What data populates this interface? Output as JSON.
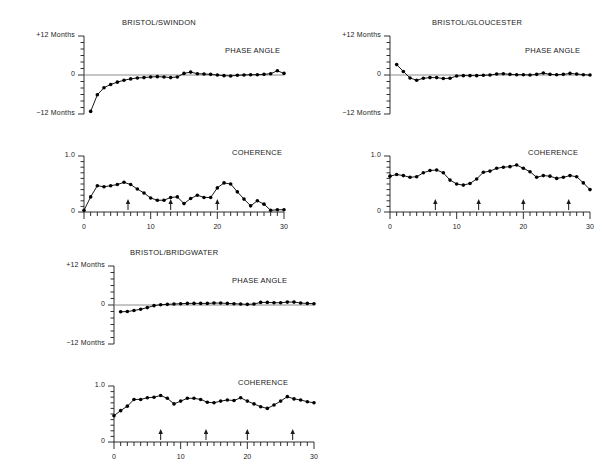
{
  "figure": {
    "panels": [
      {
        "id": "bristol-swindon",
        "title": "BRISTOL/SWINDON",
        "phase_label": "PHASE ANGLE",
        "coherence_label": "COHERENCE",
        "y_top_label": "+12 Months",
        "y_zero_label": "0",
        "y_bottom_label": "−12 Months",
        "coh_top_label": "1.0",
        "coh_zero_label": "0",
        "x_ticks": [
          "0",
          "10",
          "20",
          "30"
        ]
      },
      {
        "id": "bristol-gloucester",
        "title": "BRISTOL/GLOUCESTER",
        "phase_label": "PHASE ANGLE",
        "coherence_label": "COHERENCE",
        "y_top_label": "+12 Months",
        "y_zero_label": "0",
        "y_bottom_label": "−12 Months",
        "coh_top_label": "1.0",
        "coh_zero_label": "0",
        "x_ticks": [
          "0",
          "10",
          "20",
          "30"
        ]
      },
      {
        "id": "bristol-bridgwater",
        "title": "BRISTOL/BRIDGWATER",
        "phase_label": "PHASE ANGLE",
        "coherence_label": "COHERENCE",
        "y_top_label": "+12 Months",
        "y_zero_label": "0",
        "y_bottom_label": "−12 Months",
        "coh_top_label": "1.0",
        "coh_zero_label": "0",
        "x_ticks": [
          "0",
          "10",
          "20",
          "30"
        ]
      }
    ]
  },
  "chart_data": [
    {
      "type": "line",
      "id": "swindon-phase",
      "title": "BRISTOL/SWINDON",
      "annotation": "PHASE ANGLE",
      "xlabel": "",
      "ylabel": "Months",
      "xlim": [
        0,
        30
      ],
      "ylim": [
        -12,
        12
      ],
      "yticks": [
        -12,
        0,
        12
      ],
      "ytick_labels": [
        "−12 Months",
        "0",
        "+12 Months"
      ],
      "xticks": [
        0,
        10,
        20,
        30
      ],
      "grid": false,
      "zero_line": true,
      "x": [
        1,
        2,
        3,
        4,
        5,
        6,
        7,
        8,
        9,
        10,
        11,
        12,
        13,
        14,
        15,
        16,
        17,
        18,
        19,
        20,
        21,
        22,
        23,
        24,
        25,
        26,
        27,
        28,
        29,
        30
      ],
      "values": [
        -11.2,
        -6.1,
        -3.9,
        -2.9,
        -2.2,
        -1.6,
        -1.2,
        -0.9,
        -0.8,
        -0.6,
        -0.5,
        -0.6,
        -0.8,
        -0.6,
        0.5,
        0.9,
        0.4,
        0.3,
        0.2,
        0.0,
        -0.2,
        -0.3,
        -0.1,
        0.0,
        0.1,
        0.1,
        0.2,
        0.4,
        1.3,
        0.5
      ]
    },
    {
      "type": "line",
      "id": "swindon-coherence",
      "title": "",
      "annotation": "COHERENCE",
      "xlabel": "",
      "ylabel": "Coherence",
      "xlim": [
        0,
        30
      ],
      "ylim": [
        0,
        1.0
      ],
      "yticks": [
        0,
        1.0
      ],
      "ytick_labels": [
        "0",
        "1.0"
      ],
      "xticks": [
        0,
        10,
        20,
        30
      ],
      "grid": false,
      "arrows": [
        6.6,
        13.0,
        20.0
      ],
      "x": [
        0,
        1,
        2,
        3,
        4,
        5,
        6,
        7,
        8,
        9,
        10,
        11,
        12,
        13,
        14,
        15,
        16,
        17,
        18,
        19,
        20,
        21,
        22,
        23,
        24,
        25,
        26,
        27,
        28,
        29,
        30
      ],
      "values": [
        0.03,
        0.27,
        0.47,
        0.45,
        0.47,
        0.49,
        0.53,
        0.49,
        0.41,
        0.34,
        0.25,
        0.21,
        0.21,
        0.26,
        0.27,
        0.15,
        0.24,
        0.3,
        0.26,
        0.26,
        0.43,
        0.52,
        0.5,
        0.36,
        0.23,
        0.11,
        0.2,
        0.14,
        0.03,
        0.04,
        0.04
      ]
    },
    {
      "type": "line",
      "id": "gloucester-phase",
      "title": "BRISTOL/GLOUCESTER",
      "annotation": "PHASE ANGLE",
      "xlabel": "",
      "ylabel": "Months",
      "xlim": [
        0,
        30
      ],
      "ylim": [
        -12,
        12
      ],
      "yticks": [
        -12,
        0,
        12
      ],
      "ytick_labels": [
        "−12 Months",
        "0",
        "+12 Months"
      ],
      "xticks": [
        0,
        10,
        20,
        30
      ],
      "grid": false,
      "zero_line": true,
      "x": [
        1,
        2,
        3,
        4,
        5,
        6,
        7,
        8,
        9,
        10,
        11,
        12,
        13,
        14,
        15,
        16,
        17,
        18,
        19,
        20,
        21,
        22,
        23,
        24,
        25,
        26,
        27,
        28,
        29,
        30
      ],
      "values": [
        3.2,
        1.1,
        -0.9,
        -1.6,
        -1.0,
        -0.8,
        -0.8,
        -1.1,
        -1.0,
        -0.3,
        -0.2,
        -0.2,
        -0.2,
        -0.1,
        0.0,
        0.3,
        0.4,
        0.2,
        0.1,
        0.1,
        0.0,
        0.2,
        0.6,
        0.2,
        0.1,
        0.2,
        0.5,
        0.3,
        0.1,
        0.0
      ]
    },
    {
      "type": "line",
      "id": "gloucester-coherence",
      "title": "",
      "annotation": "COHERENCE",
      "xlabel": "",
      "ylabel": "Coherence",
      "xlim": [
        0,
        30
      ],
      "ylim": [
        0,
        1.0
      ],
      "yticks": [
        0,
        1.0
      ],
      "ytick_labels": [
        "0",
        "1.0"
      ],
      "xticks": [
        0,
        10,
        20,
        30
      ],
      "grid": false,
      "arrows": [
        6.8,
        13.3,
        20.0,
        26.8
      ],
      "x": [
        0,
        1,
        2,
        3,
        4,
        5,
        6,
        7,
        8,
        9,
        10,
        11,
        12,
        13,
        14,
        15,
        16,
        17,
        18,
        19,
        20,
        21,
        22,
        23,
        24,
        25,
        26,
        27,
        28,
        29,
        30
      ],
      "values": [
        0.64,
        0.67,
        0.65,
        0.62,
        0.63,
        0.7,
        0.74,
        0.75,
        0.7,
        0.57,
        0.5,
        0.48,
        0.51,
        0.59,
        0.71,
        0.73,
        0.78,
        0.8,
        0.81,
        0.84,
        0.78,
        0.72,
        0.62,
        0.65,
        0.64,
        0.6,
        0.62,
        0.65,
        0.63,
        0.52,
        0.4
      ]
    },
    {
      "type": "line",
      "id": "bridgwater-phase",
      "title": "BRISTOL/BRIDGWATER",
      "annotation": "PHASE ANGLE",
      "xlabel": "",
      "ylabel": "Months",
      "xlim": [
        0,
        30
      ],
      "ylim": [
        -12,
        12
      ],
      "yticks": [
        -12,
        0,
        12
      ],
      "ytick_labels": [
        "−12 Months",
        "0",
        "+12 Months"
      ],
      "xticks": [
        0,
        10,
        20,
        30
      ],
      "grid": false,
      "zero_line": true,
      "x": [
        1,
        2,
        3,
        4,
        5,
        6,
        7,
        8,
        9,
        10,
        11,
        12,
        13,
        14,
        15,
        16,
        17,
        18,
        19,
        20,
        21,
        22,
        23,
        24,
        25,
        26,
        27,
        28,
        29,
        30
      ],
      "values": [
        -2.1,
        -2.0,
        -1.7,
        -1.3,
        -0.8,
        -0.2,
        0.1,
        0.2,
        0.3,
        0.4,
        0.5,
        0.5,
        0.5,
        0.5,
        0.6,
        0.6,
        0.5,
        0.4,
        0.3,
        0.2,
        0.3,
        0.8,
        0.8,
        0.7,
        0.7,
        0.9,
        0.9,
        0.6,
        0.5,
        0.4
      ]
    },
    {
      "type": "line",
      "id": "bridgwater-coherence",
      "title": "",
      "annotation": "COHERENCE",
      "xlabel": "",
      "ylabel": "Coherence",
      "xlim": [
        0,
        30
      ],
      "ylim": [
        0,
        1.0
      ],
      "yticks": [
        0,
        1.0
      ],
      "ytick_labels": [
        "0",
        "1.0"
      ],
      "xticks": [
        0,
        10,
        20,
        30
      ],
      "grid": false,
      "arrows": [
        7.0,
        13.8,
        20.0,
        26.8
      ],
      "x": [
        0,
        1,
        2,
        3,
        4,
        5,
        6,
        7,
        8,
        9,
        10,
        11,
        12,
        13,
        14,
        15,
        16,
        17,
        18,
        19,
        20,
        21,
        22,
        23,
        24,
        25,
        26,
        27,
        28,
        29,
        30
      ],
      "values": [
        0.47,
        0.56,
        0.64,
        0.76,
        0.76,
        0.79,
        0.8,
        0.83,
        0.78,
        0.68,
        0.73,
        0.78,
        0.78,
        0.76,
        0.71,
        0.7,
        0.73,
        0.75,
        0.74,
        0.79,
        0.73,
        0.68,
        0.63,
        0.6,
        0.66,
        0.73,
        0.81,
        0.77,
        0.75,
        0.72,
        0.7
      ]
    }
  ],
  "style": {
    "line_color": "#000000",
    "marker_color": "#000000",
    "axis_color": "#1a1a1a",
    "zero_line_color": "#808080",
    "background": "#ffffff"
  }
}
